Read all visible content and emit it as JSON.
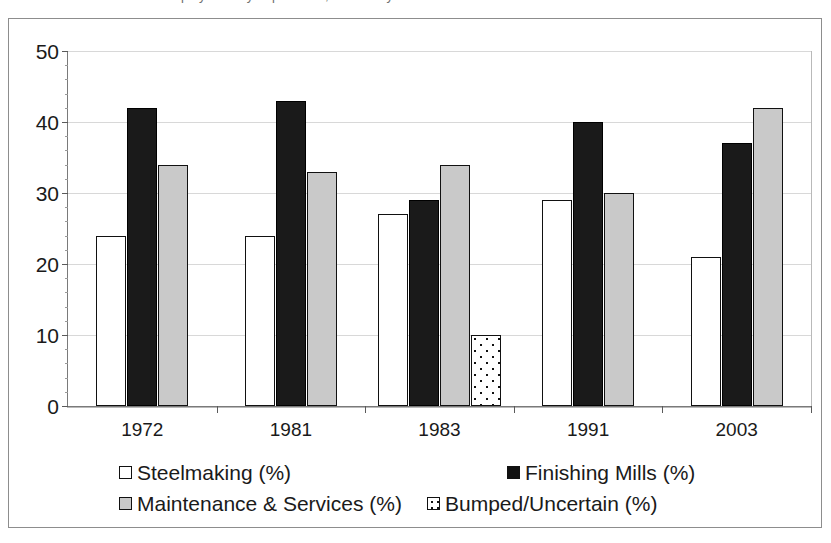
{
  "title_sliver": "Steelworker employment by department, selected years",
  "chart_data": {
    "type": "bar",
    "title": "",
    "xlabel": "",
    "ylabel": "",
    "categories": [
      "1972",
      "1981",
      "1983",
      "1991",
      "2003"
    ],
    "series": [
      {
        "name": "Steelmaking (%)",
        "key": "steelmaking",
        "swatch": "white-square",
        "color": "#ffffff",
        "values": [
          24,
          24,
          27,
          29,
          21
        ]
      },
      {
        "name": "Finishing Mills (%)",
        "key": "finishing",
        "swatch": "black-square",
        "color": "#1a1a1a",
        "values": [
          42,
          43,
          29,
          40,
          37
        ]
      },
      {
        "name": "Maintenance & Services (%)",
        "key": "maintenance",
        "swatch": "gray-square",
        "color": "#c9c9c9",
        "values": [
          34,
          33,
          34,
          30,
          42
        ]
      },
      {
        "name": "Bumped/Uncertain (%)",
        "key": "bumped",
        "swatch": "dotted-square",
        "color": "#ffffff",
        "values": [
          0,
          0,
          10,
          0,
          0
        ]
      }
    ],
    "ylim": [
      0,
      50
    ],
    "yticks": [
      0,
      10,
      20,
      30,
      40,
      50
    ],
    "ytick_labels": [
      "0",
      "10",
      "20",
      "30",
      "40",
      "50"
    ],
    "grid": "horizontal",
    "legend_position": "bottom"
  }
}
